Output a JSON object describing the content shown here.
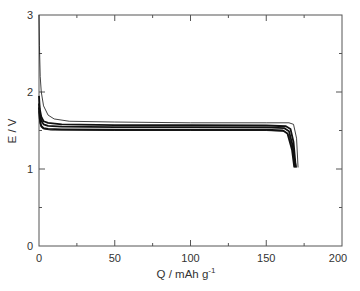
{
  "chart_data": {
    "type": "line",
    "title": "",
    "xlabel": "Q / mAh g",
    "xlabel_superscript": "-1",
    "ylabel": "E / V",
    "xlim": [
      0,
      200
    ],
    "ylim": [
      0,
      3
    ],
    "x_ticks": [
      0,
      50,
      100,
      150,
      200
    ],
    "x_minor_ticks": [
      25,
      75,
      125,
      175
    ],
    "y_ticks": [
      0,
      1,
      2,
      3
    ],
    "y_minor_ticks": [
      0.5,
      1.5,
      2.5
    ],
    "grid": false,
    "legend": null,
    "series": [
      {
        "name": "cycle-1",
        "stroke_width": 0.8,
        "points": [
          [
            0,
            3.0
          ],
          [
            0.3,
            2.6
          ],
          [
            0.8,
            2.2
          ],
          [
            1.5,
            2.0
          ],
          [
            3,
            1.82
          ],
          [
            6,
            1.7
          ],
          [
            10,
            1.65
          ],
          [
            20,
            1.62
          ],
          [
            50,
            1.61
          ],
          [
            100,
            1.6
          ],
          [
            150,
            1.6
          ],
          [
            165,
            1.6
          ],
          [
            168,
            1.58
          ],
          [
            170,
            1.4
          ],
          [
            171,
            1.02
          ]
        ]
      },
      {
        "name": "cycle-2",
        "stroke_width": 1.8,
        "points": [
          [
            0,
            1.95
          ],
          [
            0.5,
            1.78
          ],
          [
            1.5,
            1.68
          ],
          [
            3,
            1.62
          ],
          [
            6,
            1.6
          ],
          [
            15,
            1.58
          ],
          [
            50,
            1.57
          ],
          [
            100,
            1.57
          ],
          [
            150,
            1.565
          ],
          [
            163,
            1.555
          ],
          [
            166,
            1.52
          ],
          [
            168,
            1.35
          ],
          [
            169.5,
            1.02
          ]
        ]
      },
      {
        "name": "cycle-3",
        "stroke_width": 1.8,
        "points": [
          [
            0,
            1.85
          ],
          [
            0.5,
            1.72
          ],
          [
            1.5,
            1.63
          ],
          [
            3,
            1.58
          ],
          [
            6,
            1.56
          ],
          [
            15,
            1.55
          ],
          [
            50,
            1.545
          ],
          [
            100,
            1.545
          ],
          [
            150,
            1.54
          ],
          [
            162,
            1.53
          ],
          [
            165,
            1.49
          ],
          [
            167.5,
            1.3
          ],
          [
            169,
            1.02
          ]
        ]
      },
      {
        "name": "cycle-4",
        "stroke_width": 1.8,
        "points": [
          [
            0,
            1.8
          ],
          [
            0.5,
            1.65
          ],
          [
            1.5,
            1.56
          ],
          [
            3,
            1.53
          ],
          [
            6,
            1.52
          ],
          [
            15,
            1.515
          ],
          [
            50,
            1.51
          ],
          [
            100,
            1.51
          ],
          [
            150,
            1.51
          ],
          [
            161,
            1.5
          ],
          [
            164,
            1.46
          ],
          [
            167,
            1.25
          ],
          [
            168.5,
            1.02
          ]
        ]
      },
      {
        "name": "cycle-5",
        "stroke_width": 0.9,
        "points": [
          [
            0,
            1.75
          ],
          [
            0.5,
            1.6
          ],
          [
            1.5,
            1.54
          ],
          [
            3,
            1.52
          ],
          [
            8,
            1.505
          ],
          [
            50,
            1.5
          ],
          [
            100,
            1.5
          ],
          [
            150,
            1.5
          ],
          [
            162,
            1.49
          ],
          [
            165,
            1.44
          ],
          [
            168,
            1.2
          ],
          [
            170,
            1.02
          ]
        ]
      }
    ]
  },
  "labels": {
    "x_tick_0": "0",
    "x_tick_1": "50",
    "x_tick_2": "100",
    "x_tick_3": "150",
    "x_tick_4": "200",
    "y_tick_0": "0",
    "y_tick_1": "1",
    "y_tick_2": "2",
    "y_tick_3": "3",
    "xlabel": "Q / mAh g",
    "xlabel_sup": "-1",
    "ylabel": "E / V"
  },
  "colors": {
    "axis": "#555555",
    "line": "#111111"
  }
}
